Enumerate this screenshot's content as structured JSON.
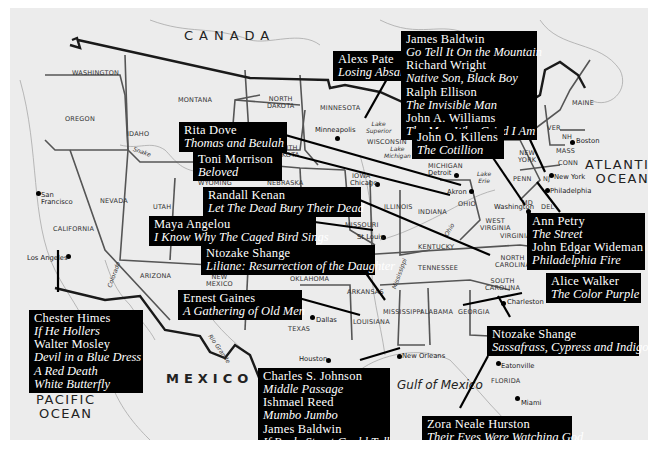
{
  "map": {
    "regions": {
      "canada": "CANADA",
      "mexico": "MEXICO",
      "atlantic": [
        "ATLANTIC",
        "OCEAN"
      ],
      "pacific": [
        "PACIFIC",
        "OCEAN"
      ],
      "gulf": "Gulf of Mexico"
    },
    "states": {
      "washington": "WASHINGTON",
      "oregon": "OREGON",
      "idaho": "IDAHO",
      "montana": "MONTANA",
      "north_dakota": [
        "NORTH",
        "DAKOTA"
      ],
      "south_dakota": [
        "SOUTH",
        "DAKOTA"
      ],
      "minnesota": "MINNESOTA",
      "wisconsin": "WISCONSIN",
      "michigan": "MICHIGAN",
      "wyoming": "WYOMING",
      "nebraska": "NEBRASKA",
      "iowa": "IOWA",
      "illinois": "ILLINOIS",
      "indiana": "INDIANA",
      "ohio": "OHIO",
      "nevada": "NEVADA",
      "utah": "UTAH",
      "california": "CALIFORNIA",
      "arizona": "ARIZONA",
      "new_mexico": [
        "NEW",
        "MEXICO"
      ],
      "oklahoma": "OKLAHOMA",
      "texas": "TEXAS",
      "missouri": "MISSOURI",
      "arkansas": "ARKANSAS",
      "louisiana": "LOUISIANA",
      "mississippi": "MISSISSIPPI",
      "alabama": "ALABAMA",
      "georgia": "GEORGIA",
      "florida": "FLORIDA",
      "tennessee": "TENNESSEE",
      "kentucky": "KENTUCKY",
      "west_virginia": [
        "WEST",
        "VIRGINIA"
      ],
      "virginia": "VIRGINIA",
      "north_carolina": [
        "NORTH",
        "CAROLINA"
      ],
      "south_carolina": [
        "SOUTH",
        "CAROLINA"
      ],
      "penn": "PENN",
      "new_york": [
        "NEW",
        "YORK"
      ],
      "maine": "MAINE",
      "vermont": "VER",
      "nh": "NH",
      "mass": "MASS",
      "conn": "CONN",
      "nj": "NJ",
      "md": "MD",
      "del": "DEL"
    },
    "water": {
      "lake_superior": [
        "Lake",
        "Superior"
      ],
      "lake_michigan": [
        "Lake",
        "Michigan"
      ],
      "lake_erie": [
        "Lake",
        "Erie"
      ],
      "snake": "Snake",
      "colorado": "Colorado",
      "rio_grande": "Rio Grande",
      "ohio_river": "Ohio",
      "mississippi_river": "Mississippi"
    },
    "cities": {
      "san_francisco": [
        "San",
        "Francisco"
      ],
      "los_angeles": "Los Angeles",
      "minneapolis": "Minneapolis",
      "chicago": "Chicago",
      "detroit": "Detroit",
      "akron": "Akron",
      "st_louis": "St Louis",
      "dallas": "Dallas",
      "houston": "Houston",
      "new_orleans": "New Orleans",
      "charleston": "Charleston",
      "eatonville": "Eatonville",
      "miami": "Miami",
      "washington_dc": "Washington",
      "philadelphia": "Philadelphia",
      "new_york_city": "New York",
      "boston": "Boston"
    }
  },
  "callouts": [
    {
      "id": "alexs-pate",
      "location": "Minneapolis",
      "entries": [
        {
          "author": "Alexs Pate",
          "titles": "Losing Absalom"
        }
      ]
    },
    {
      "id": "northeast-group",
      "location": "New York",
      "entries": [
        {
          "author": "James Baldwin",
          "titles": "Go Tell It On the Mountain"
        },
        {
          "author": "Richard Wright",
          "titles": "Native Son, Black Boy"
        },
        {
          "author": "Ralph Ellison",
          "titles": "The Invisible Man"
        },
        {
          "author": "John A. Williams",
          "titles": "The Man Who Cried I Am"
        }
      ]
    },
    {
      "id": "rita-dove",
      "location": "Akron",
      "entries": [
        {
          "author": "Rita Dove",
          "titles": "Thomas and Beulah"
        }
      ]
    },
    {
      "id": "john-killens",
      "location": "Washington",
      "entries": [
        {
          "author": "John O. Killens",
          "titles": "The Cotillion"
        }
      ]
    },
    {
      "id": "toni-morrison",
      "location": "Ohio",
      "entries": [
        {
          "author": "Toni Morrison",
          "titles": "Beloved"
        }
      ]
    },
    {
      "id": "randall-kenan",
      "location": "North Carolina",
      "entries": [
        {
          "author": "Randall Kenan",
          "titles": "Let The Dead Bury Their Dead"
        }
      ]
    },
    {
      "id": "maya-angelou",
      "location": "St Louis",
      "entries": [
        {
          "author": "Maya Angelou",
          "titles": "I Know Why The Caged Bird Sings"
        }
      ]
    },
    {
      "id": "ntozake-liliane",
      "location": "Mississippi",
      "entries": [
        {
          "author": "Ntozake Shange",
          "titles": "Liliane: Resurrection of the Daughter"
        }
      ]
    },
    {
      "id": "ann-petry-wideman",
      "location": "Philadelphia",
      "entries": [
        {
          "author": "Ann Petry",
          "titles": "The Street"
        },
        {
          "author": "John Edgar Wideman",
          "titles": "Philadelphia Fire"
        }
      ]
    },
    {
      "id": "alice-walker",
      "location": "Georgia",
      "entries": [
        {
          "author": "Alice Walker",
          "titles": "The Color Purple"
        }
      ]
    },
    {
      "id": "ernest-gaines",
      "location": "Louisiana",
      "entries": [
        {
          "author": "Ernest Gaines",
          "titles": "A Gathering of Old Men"
        }
      ]
    },
    {
      "id": "la-group",
      "location": "Los Angeles",
      "entries": [
        {
          "author": "Chester Himes",
          "titles": "If He Hollers"
        },
        {
          "author": "Walter Mosley",
          "titles": "Devil in a Blue Dress"
        },
        {
          "author": "",
          "titles": "A Red Death"
        },
        {
          "author": "",
          "titles": "White Butterfly"
        }
      ]
    },
    {
      "id": "ntozake-sassafrass",
      "location": "Charleston",
      "entries": [
        {
          "author": "Ntozake Shange",
          "titles": "Sassafrass, Cypress and Indigo"
        }
      ]
    },
    {
      "id": "new-orleans-group",
      "location": "New Orleans",
      "entries": [
        {
          "author": "Charles S. Johnson",
          "titles": "Middle Passage"
        },
        {
          "author": "Ishmael Reed",
          "titles": "Mumbo Jumbo"
        },
        {
          "author": "James Baldwin",
          "titles": "If Beale Street Could Talk"
        }
      ]
    },
    {
      "id": "zora-hurston",
      "location": "Eatonville",
      "entries": [
        {
          "author": "Zora Neale Hurston",
          "titles": "Their Eyes Were Watching God"
        }
      ]
    }
  ],
  "colors": {
    "map_bg": "#ececec",
    "border": "#1a1a1a",
    "state_line": "#555555",
    "river": "#9a9a9a",
    "box_bg": "#000000",
    "box_text": "#ffffff"
  }
}
